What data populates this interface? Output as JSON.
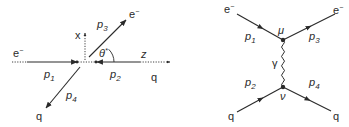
{
  "left_diagram": {
    "title": "Kinematics in centre-of-mass frame",
    "incoming_electron": {
      "label": "e",
      "charge": "−",
      "momentum": "p",
      "momentum_sub": "1"
    },
    "incoming_quark": {
      "label": "q",
      "momentum": "p",
      "momentum_sub": "2"
    },
    "outgoing_electron": {
      "label": "e",
      "charge": "−",
      "momentum": "p",
      "momentum_sub": "3"
    },
    "outgoing_quark": {
      "label": "q",
      "momentum": "p",
      "momentum_sub": "4"
    },
    "axes": {
      "x": "x",
      "z": "z"
    },
    "angle": {
      "symbol": "θ",
      "star": "*"
    }
  },
  "right_diagram": {
    "title": "Feynman diagram",
    "e_in": {
      "label": "e",
      "charge": "−",
      "momentum": "p",
      "momentum_sub": "1"
    },
    "e_out": {
      "label": "e",
      "charge": "−",
      "momentum": "p",
      "momentum_sub": "3"
    },
    "q_in": {
      "label": "q",
      "momentum": "p",
      "momentum_sub": "2"
    },
    "q_out": {
      "label": "q",
      "momentum": "p",
      "momentum_sub": "4"
    },
    "upper_vertex_index": "μ",
    "lower_vertex_index": "ν",
    "propagator": "γ"
  },
  "colors": {
    "line": "#2a2a2a",
    "background": "#ffffff"
  }
}
